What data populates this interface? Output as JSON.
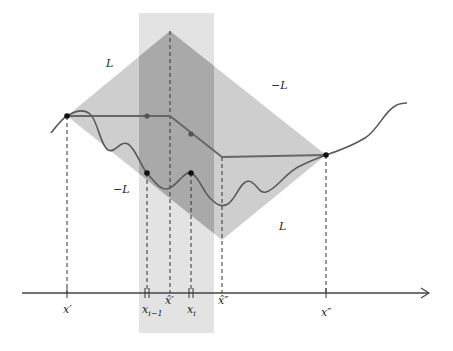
{
  "figure": {
    "colors": {
      "band": "#e3e3e3",
      "diamond": "#c6c6c6",
      "overlap": "#a9a9a9",
      "curve": "#5a5a5a",
      "polyline": "#666666",
      "point": "#111111",
      "axis": "#444444"
    },
    "slope_labels": {
      "upper_left": "L",
      "upper_right": "−L",
      "lower_left": "−L",
      "lower_right": "L"
    },
    "axis_labels": {
      "x_prime": "x′",
      "x_i_minus_1": "x",
      "x_i_minus_1_sub": "i−1",
      "x_hat_prime": "x̂′",
      "x_i": "x",
      "x_i_sub": "i",
      "x_hat_double_prime": "x̂″",
      "x_double_prime": "x″"
    },
    "key_points": {
      "left_vertex": [
        67,
        116
      ],
      "top_vertex": [
        170,
        31
      ],
      "right_vertex": [
        326,
        155
      ],
      "bottom_vertex": [
        222,
        240
      ],
      "curve_point_i_minus_1": [
        147,
        173
      ],
      "curve_point_i": [
        191,
        173
      ],
      "upper_point_i_minus_1": [
        147,
        116
      ],
      "upper_point_i": [
        191,
        134
      ]
    }
  }
}
